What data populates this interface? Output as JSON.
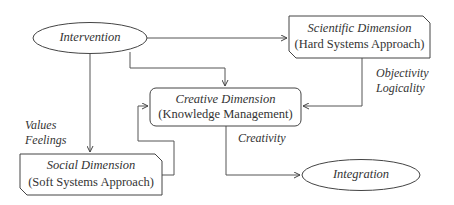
{
  "diagram": {
    "nodes": {
      "intervention": {
        "label": "Intervention",
        "shape": "ellipse"
      },
      "scientific": {
        "title": "Scientific Dimension",
        "subtitle": "(Hard Systems Approach)",
        "shape": "snipped-rectangle"
      },
      "creative": {
        "title": "Creative Dimension",
        "subtitle": "(Knowledge Management)",
        "shape": "rounded-rectangle"
      },
      "social": {
        "title": "Social Dimension",
        "subtitle": "(Soft Systems Approach)",
        "shape": "snipped-rectangle"
      },
      "integration": {
        "label": "Integration",
        "shape": "ellipse"
      }
    },
    "edge_labels": {
      "values": "Values",
      "feelings": "Feelings",
      "objectivity": "Objectivity",
      "logicality": "Logicality",
      "creativity": "Creativity"
    },
    "edges": [
      {
        "from": "Intervention",
        "to": "Scientific Dimension"
      },
      {
        "from": "Intervention",
        "to": "Creative Dimension"
      },
      {
        "from": "Intervention",
        "to": "Social Dimension",
        "label": "Values / Feelings"
      },
      {
        "from": "Scientific Dimension",
        "to": "Creative Dimension",
        "label": "Objectivity / Logicality"
      },
      {
        "from": "Social Dimension",
        "to": "Creative Dimension"
      },
      {
        "from": "Creative Dimension",
        "to": "Integration",
        "label": "Creativity"
      }
    ],
    "colors": {
      "stroke": "#444444",
      "text": "#333333",
      "background": "#ffffff"
    }
  }
}
